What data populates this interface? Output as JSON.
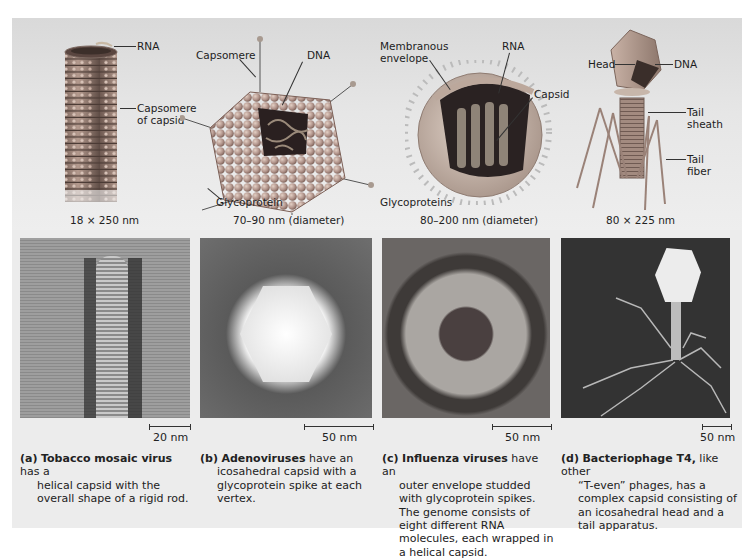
{
  "figure": {
    "panels": [
      {
        "id": "a",
        "dimension": "18 × 250 nm",
        "labels": [
          "RNA",
          "Capsomere of capsid"
        ],
        "scale_bar": "20 nm",
        "caption_tag": "(a)",
        "caption_bold": "Tobacco mosaic virus",
        "caption_first": " has a",
        "caption_rest": "helical capsid with the overall shape of a rigid rod."
      },
      {
        "id": "b",
        "dimension": "70–90 nm (diameter)",
        "labels": [
          "Capsomere",
          "DNA",
          "Glycoprotein"
        ],
        "scale_bar": "50 nm",
        "caption_tag": "(b)",
        "caption_bold": "Adenoviruses",
        "caption_first": " have an",
        "caption_rest": "icosahedral capsid with a glycoprotein spike at each vertex."
      },
      {
        "id": "c",
        "dimension": "80–200 nm (diameter)",
        "labels": [
          "Membranous envelope",
          "RNA",
          "Capsid",
          "Glycoproteins"
        ],
        "scale_bar": "50 nm",
        "caption_tag": "(c)",
        "caption_bold": "Influenza viruses",
        "caption_first": " have an",
        "caption_rest": "outer envelope studded with glycoprotein spikes. The genome consists of eight different RNA molecules, each wrapped in a helical capsid."
      },
      {
        "id": "d",
        "dimension": "80 × 225 nm",
        "labels": [
          "Head",
          "DNA",
          "Tail sheath",
          "Tail fiber"
        ],
        "scale_bar": "50 nm",
        "caption_tag": "(d)",
        "caption_bold": "Bacteriophage T4,",
        "caption_first": " like other",
        "caption_rest": "“T-even” phages, has a complex capsid consisting of an icosahedral head and a tail apparatus."
      }
    ],
    "label_text": {
      "a_rna": "RNA",
      "a_caps1": "Capsomere",
      "a_caps2": "of capsid",
      "b_caps": "Capsomere",
      "b_dna": "DNA",
      "b_glyco": "Glycoprotein",
      "c_mem1": "Membranous",
      "c_mem2": "envelope",
      "c_rna": "RNA",
      "c_capsid": "Capsid",
      "c_glyco": "Glycoproteins",
      "d_head": "Head",
      "d_dna": "DNA",
      "d_tail1": "Tail",
      "d_tail2": "sheath",
      "d_fib1": "Tail",
      "d_fib2": "fiber"
    },
    "colors": {
      "panel_bg": "#ececec",
      "capsomere": "#b89a8c",
      "capsomere_dark": "#8a6c60",
      "envelope": "#c9b3a6",
      "rna_interior": "#5a4a44",
      "micrograph_dark": "#3a3a3a",
      "micrograph_light": "#e8e8e8"
    }
  }
}
